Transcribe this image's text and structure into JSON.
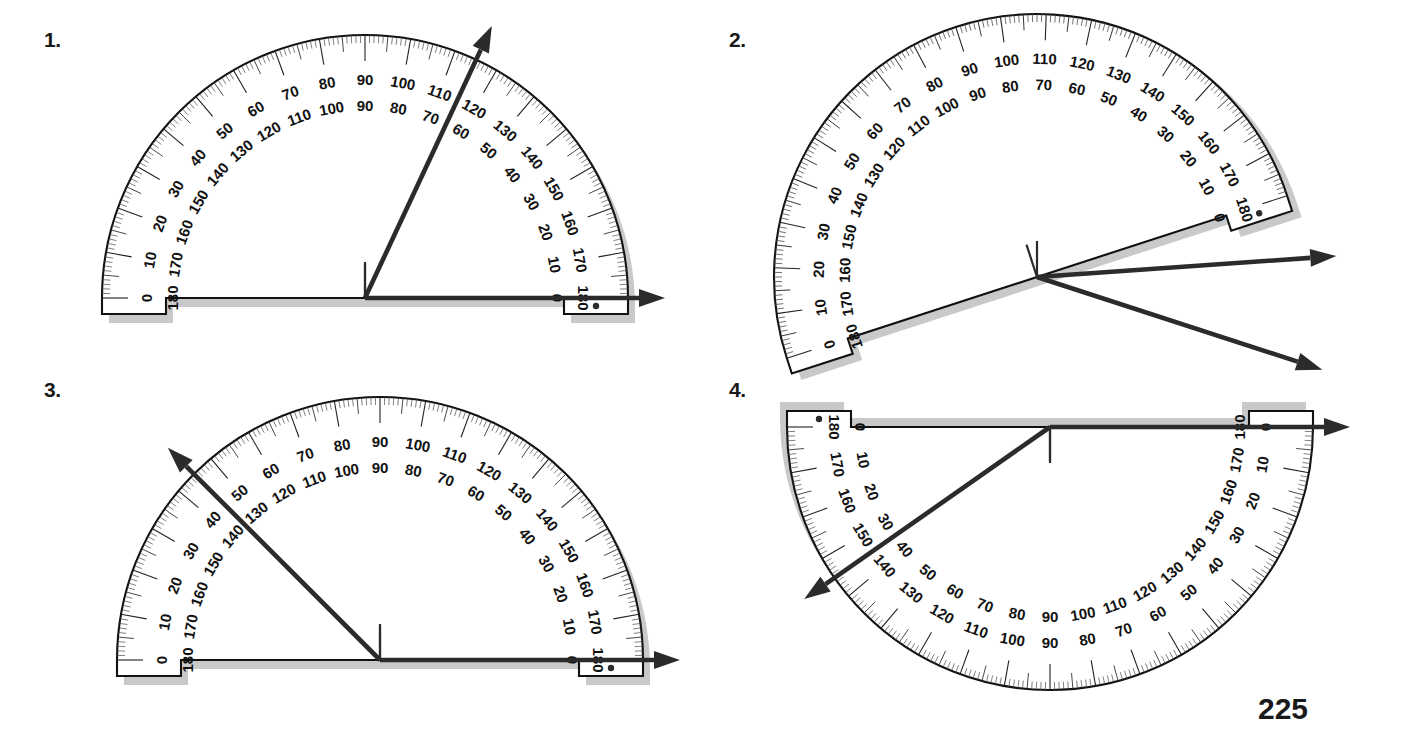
{
  "page": {
    "page_number": "225",
    "background_color": "#ffffff",
    "ink_color": "#1a1a1a",
    "shadow_color": "#c9c9c9"
  },
  "items": [
    {
      "id": "item-1",
      "label": "1.",
      "label_x": 44,
      "label_y": 28,
      "name": "protractor-1",
      "rotation_deg": 0,
      "flipped": false,
      "center_x": 365,
      "center_y": 298,
      "radius": 263,
      "baseline_angle_deg": 0,
      "ray_angle_deg": 65,
      "ray_length": 300,
      "base_ray_length": 300,
      "reading_outer": 115,
      "reading_inner": 65
    },
    {
      "id": "item-2",
      "label": "2.",
      "label_x": 729,
      "label_y": 28,
      "name": "protractor-2",
      "rotation_deg": -18,
      "flipped": false,
      "center_x": 337,
      "center_y": 277,
      "radius": 263,
      "baseline_angle_deg": -18,
      "ray_angle_deg": 22,
      "ray_length": 300,
      "base_ray_length": 300,
      "reading_outer": 140,
      "reading_inner": 40
    },
    {
      "id": "item-3",
      "label": "3.",
      "label_x": 44,
      "label_y": 378,
      "name": "protractor-3",
      "rotation_deg": 0,
      "flipped": false,
      "center_x": 380,
      "center_y": 300,
      "radius": 263,
      "baseline_angle_deg": 0,
      "ray_angle_deg": 135,
      "ray_length": 300,
      "base_ray_length": 300,
      "reading_outer": 45,
      "reading_inner": 135
    },
    {
      "id": "item-4",
      "label": "4.",
      "label_x": 729,
      "label_y": 378,
      "name": "protractor-4",
      "rotation_deg": 180,
      "flipped": false,
      "center_x": 330,
      "center_y": 57,
      "radius": 263,
      "baseline_angle_deg": 0,
      "ray_angle_deg": 215,
      "ray_length": 300,
      "base_ray_length": 300,
      "reading_outer": 35,
      "reading_inner": 145
    }
  ],
  "scale": {
    "outer_labels": [
      0,
      10,
      20,
      30,
      40,
      50,
      60,
      70,
      80,
      90,
      100,
      110,
      120,
      130,
      140,
      150,
      160,
      170,
      180
    ],
    "inner_labels": [
      180,
      170,
      160,
      150,
      140,
      130,
      120,
      110,
      100,
      90,
      80,
      70,
      60,
      50,
      40,
      30,
      20,
      10,
      0
    ],
    "tick_step_deg": 1,
    "mid_tick_step_deg": 5,
    "major_tick_step_deg": 10,
    "outer_scale_name": "outer-degree-scale",
    "inner_scale_name": "inner-degree-scale"
  }
}
